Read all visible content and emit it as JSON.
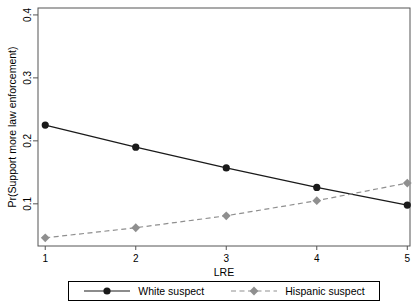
{
  "chart_data": {
    "type": "line",
    "title": "",
    "xlabel": "LRE",
    "ylabel": "Pr(Support more law enforcement)",
    "x": [
      1,
      2,
      3,
      4,
      5
    ],
    "x_tick_labels": [
      "1",
      "2",
      "3",
      "4",
      "5"
    ],
    "y_tick_values": [
      0.1,
      0.2,
      0.3,
      0.4
    ],
    "y_tick_labels": [
      "0.1",
      "0.2",
      "0.3",
      "0.4"
    ],
    "xlim": [
      0.92,
      5.03
    ],
    "ylim": [
      0.033,
      0.411
    ],
    "grid": false,
    "legend_position": "bottom-center",
    "frame_color": "#545454",
    "text_color": "#000000",
    "series": [
      {
        "name": "White suspect",
        "marker": "circle",
        "line_style": "solid",
        "color": "#1a1a1a",
        "values": [
          0.225,
          0.19,
          0.157,
          0.126,
          0.098
        ]
      },
      {
        "name": "Hispanic suspect",
        "marker": "diamond",
        "line_style": "dashed",
        "color": "#8f8f8f",
        "values": [
          0.046,
          0.062,
          0.081,
          0.105,
          0.133
        ]
      }
    ]
  }
}
